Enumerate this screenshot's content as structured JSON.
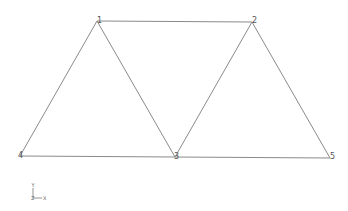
{
  "diagram": {
    "type": "truss",
    "nodes": [
      {
        "id": "1",
        "label": "1",
        "x": 97,
        "y": 21
      },
      {
        "id": "2",
        "label": "2",
        "x": 252,
        "y": 22
      },
      {
        "id": "3",
        "label": "3",
        "x": 175,
        "y": 157
      },
      {
        "id": "4",
        "label": "4",
        "x": 20,
        "y": 156
      },
      {
        "id": "5",
        "label": "5",
        "x": 330,
        "y": 158
      }
    ],
    "members": [
      [
        "1",
        "2"
      ],
      [
        "1",
        "4"
      ],
      [
        "1",
        "3"
      ],
      [
        "2",
        "3"
      ],
      [
        "2",
        "5"
      ],
      [
        "4",
        "3"
      ],
      [
        "3",
        "5"
      ]
    ],
    "axis_triad": {
      "y_label": "Y",
      "x_label": "X",
      "z_label": "Z"
    },
    "colors": {
      "member": "#8a8a8a",
      "label": "#555555",
      "background": "#ffffff"
    }
  }
}
